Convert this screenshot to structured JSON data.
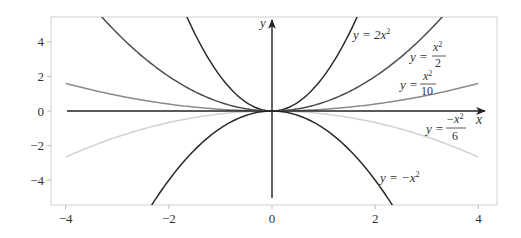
{
  "chart_data": {
    "type": "line",
    "title": "",
    "xlabel": "",
    "ylabel": "",
    "xlim": [
      -4.4,
      4.3
    ],
    "ylim": [
      -5.4,
      5.4
    ],
    "grid": false,
    "legend": "none (inline annotations)",
    "x_ticks": [
      -4,
      -2,
      0,
      2,
      4
    ],
    "y_ticks": [
      -4,
      -2,
      0,
      2,
      4
    ],
    "x_tick_labels": [
      "−4",
      "−2",
      "0",
      "2",
      "4"
    ],
    "y_tick_labels": [
      "−4",
      "−2",
      "0",
      "2",
      "4"
    ],
    "axis_arrows": {
      "x_label": "x",
      "y_label": "y"
    },
    "x_domain": [
      -4,
      4
    ],
    "series": [
      {
        "name": "y = 2x^2",
        "coef": 2,
        "color": "#2b2b2b",
        "label_parts": {
          "lhs": "y = 2x",
          "sup": "2"
        }
      },
      {
        "name": "y = x^2/2",
        "coef": 0.5,
        "color": "#4d4d4d",
        "label_parts": {
          "lhs": "y =",
          "num": "x",
          "sup": "2",
          "den": "2"
        }
      },
      {
        "name": "y = x^2/10",
        "coef": 0.1,
        "color": "#8a8a8a",
        "label_parts": {
          "lhs": "y =",
          "num": "x",
          "sup": "2",
          "den": "10"
        }
      },
      {
        "name": "y = -x^2/6",
        "coef": -0.16667,
        "color": "#d2d2d2",
        "label_parts": {
          "lhs": "y =",
          "num": "−x",
          "sup": "2",
          "den": "6"
        }
      },
      {
        "name": "y = -x^2",
        "coef": -1,
        "color": "#2b2b2b",
        "label_parts": {
          "lhs": "y = −x",
          "sup": "2"
        }
      }
    ],
    "sample_values": {
      "x": [
        -4,
        -3,
        -2,
        -1,
        0,
        1,
        2,
        3,
        4
      ],
      "y = 2x^2": [
        32,
        18,
        8,
        2,
        0,
        2,
        8,
        18,
        32
      ],
      "y = x^2/2": [
        8,
        4.5,
        2,
        0.5,
        0,
        0.5,
        2,
        4.5,
        8
      ],
      "y = x^2/10": [
        1.6,
        0.9,
        0.4,
        0.1,
        0,
        0.1,
        0.4,
        0.9,
        1.6
      ],
      "y = -x^2/6": [
        -2.67,
        -1.5,
        -0.67,
        -0.17,
        0,
        -0.17,
        -0.67,
        -1.5,
        -2.67
      ],
      "y = -x^2": [
        -16,
        -9,
        -4,
        -1,
        0,
        -1,
        -4,
        -9,
        -16
      ]
    }
  },
  "frame": {
    "color": "#d0d0d0"
  },
  "axis_color": "#222222"
}
